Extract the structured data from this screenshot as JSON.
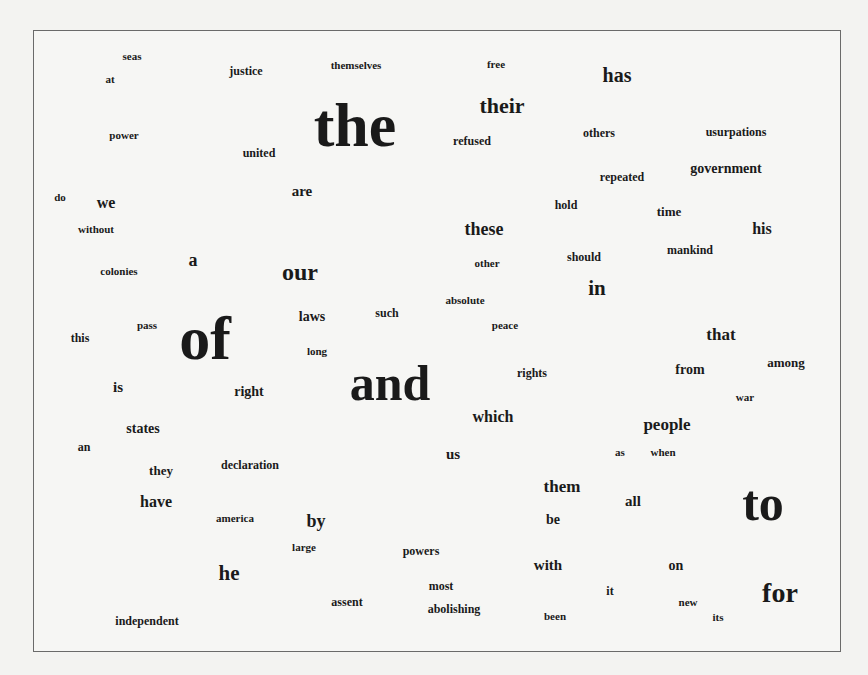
{
  "cloud": {
    "type": "word-cloud",
    "frame": {
      "left": 33,
      "top": 30,
      "right": 842,
      "bottom": 653
    },
    "words": [
      {
        "text": "the",
        "x": 355,
        "y": 125,
        "size": 62
      },
      {
        "text": "of",
        "x": 205,
        "y": 338,
        "size": 62
      },
      {
        "text": "and",
        "x": 390,
        "y": 383,
        "size": 50
      },
      {
        "text": "to",
        "x": 763,
        "y": 503,
        "size": 50
      },
      {
        "text": "for",
        "x": 780,
        "y": 593,
        "size": 28
      },
      {
        "text": "their",
        "x": 502,
        "y": 106,
        "size": 22
      },
      {
        "text": "has",
        "x": 617,
        "y": 75,
        "size": 20
      },
      {
        "text": "our",
        "x": 300,
        "y": 272,
        "size": 24
      },
      {
        "text": "in",
        "x": 597,
        "y": 288,
        "size": 21
      },
      {
        "text": "he",
        "x": 229,
        "y": 573,
        "size": 21
      },
      {
        "text": "these",
        "x": 484,
        "y": 229,
        "size": 18
      },
      {
        "text": "that",
        "x": 721,
        "y": 334,
        "size": 17
      },
      {
        "text": "people",
        "x": 667,
        "y": 424,
        "size": 17
      },
      {
        "text": "them",
        "x": 562,
        "y": 486,
        "size": 17
      },
      {
        "text": "have",
        "x": 156,
        "y": 502,
        "size": 16
      },
      {
        "text": "by",
        "x": 316,
        "y": 521,
        "size": 18
      },
      {
        "text": "which",
        "x": 493,
        "y": 417,
        "size": 16
      },
      {
        "text": "his",
        "x": 762,
        "y": 229,
        "size": 16
      },
      {
        "text": "we",
        "x": 106,
        "y": 203,
        "size": 16
      },
      {
        "text": "a",
        "x": 193,
        "y": 260,
        "size": 18
      },
      {
        "text": "are",
        "x": 302,
        "y": 191,
        "size": 15
      },
      {
        "text": "government",
        "x": 726,
        "y": 169,
        "size": 14
      },
      {
        "text": "laws",
        "x": 312,
        "y": 317,
        "size": 14
      },
      {
        "text": "is",
        "x": 118,
        "y": 387,
        "size": 15
      },
      {
        "text": "right",
        "x": 249,
        "y": 392,
        "size": 14
      },
      {
        "text": "states",
        "x": 143,
        "y": 429,
        "size": 14
      },
      {
        "text": "from",
        "x": 690,
        "y": 370,
        "size": 14
      },
      {
        "text": "among",
        "x": 786,
        "y": 362,
        "size": 13
      },
      {
        "text": "us",
        "x": 453,
        "y": 454,
        "size": 15
      },
      {
        "text": "all",
        "x": 633,
        "y": 501,
        "size": 15
      },
      {
        "text": "be",
        "x": 553,
        "y": 520,
        "size": 14
      },
      {
        "text": "with",
        "x": 548,
        "y": 565,
        "size": 15
      },
      {
        "text": "on",
        "x": 676,
        "y": 566,
        "size": 14
      },
      {
        "text": "they",
        "x": 161,
        "y": 470,
        "size": 13
      },
      {
        "text": "mankind",
        "x": 690,
        "y": 250,
        "size": 12
      },
      {
        "text": "seas",
        "x": 132,
        "y": 56,
        "size": 11
      },
      {
        "text": "at",
        "x": 110,
        "y": 79,
        "size": 11
      },
      {
        "text": "justice",
        "x": 246,
        "y": 71,
        "size": 12
      },
      {
        "text": "themselves",
        "x": 356,
        "y": 65,
        "size": 11
      },
      {
        "text": "free",
        "x": 496,
        "y": 64,
        "size": 11
      },
      {
        "text": "power",
        "x": 124,
        "y": 135,
        "size": 11
      },
      {
        "text": "united",
        "x": 259,
        "y": 153,
        "size": 12
      },
      {
        "text": "refused",
        "x": 472,
        "y": 141,
        "size": 12
      },
      {
        "text": "others",
        "x": 599,
        "y": 133,
        "size": 12
      },
      {
        "text": "usurpations",
        "x": 736,
        "y": 132,
        "size": 12
      },
      {
        "text": "repeated",
        "x": 622,
        "y": 177,
        "size": 12
      },
      {
        "text": "hold",
        "x": 566,
        "y": 205,
        "size": 12
      },
      {
        "text": "time",
        "x": 669,
        "y": 211,
        "size": 13
      },
      {
        "text": "do",
        "x": 60,
        "y": 197,
        "size": 11
      },
      {
        "text": "without",
        "x": 96,
        "y": 229,
        "size": 11
      },
      {
        "text": "colonies",
        "x": 119,
        "y": 271,
        "size": 11
      },
      {
        "text": "other",
        "x": 487,
        "y": 263,
        "size": 11
      },
      {
        "text": "should",
        "x": 584,
        "y": 257,
        "size": 12
      },
      {
        "text": "absolute",
        "x": 465,
        "y": 300,
        "size": 11
      },
      {
        "text": "such",
        "x": 387,
        "y": 313,
        "size": 12
      },
      {
        "text": "peace",
        "x": 505,
        "y": 325,
        "size": 11
      },
      {
        "text": "pass",
        "x": 147,
        "y": 325,
        "size": 11
      },
      {
        "text": "this",
        "x": 80,
        "y": 338,
        "size": 12
      },
      {
        "text": "long",
        "x": 317,
        "y": 351,
        "size": 11
      },
      {
        "text": "rights",
        "x": 532,
        "y": 373,
        "size": 12
      },
      {
        "text": "war",
        "x": 745,
        "y": 397,
        "size": 11
      },
      {
        "text": "an",
        "x": 84,
        "y": 447,
        "size": 12
      },
      {
        "text": "declaration",
        "x": 250,
        "y": 465,
        "size": 12
      },
      {
        "text": "as",
        "x": 620,
        "y": 452,
        "size": 11
      },
      {
        "text": "when",
        "x": 663,
        "y": 452,
        "size": 11
      },
      {
        "text": "america",
        "x": 235,
        "y": 518,
        "size": 11
      },
      {
        "text": "large",
        "x": 304,
        "y": 547,
        "size": 11
      },
      {
        "text": "powers",
        "x": 421,
        "y": 551,
        "size": 12
      },
      {
        "text": "most",
        "x": 441,
        "y": 586,
        "size": 12
      },
      {
        "text": "it",
        "x": 610,
        "y": 591,
        "size": 12
      },
      {
        "text": "assent",
        "x": 347,
        "y": 602,
        "size": 12
      },
      {
        "text": "abolishing",
        "x": 454,
        "y": 609,
        "size": 12
      },
      {
        "text": "new",
        "x": 688,
        "y": 602,
        "size": 11
      },
      {
        "text": "been",
        "x": 555,
        "y": 616,
        "size": 11
      },
      {
        "text": "its",
        "x": 718,
        "y": 617,
        "size": 11
      },
      {
        "text": "independent",
        "x": 147,
        "y": 621,
        "size": 12
      }
    ]
  },
  "colors": {
    "background": "#f3f3f1",
    "text": "#1a1a1a",
    "frame_border": "#6a6a6a"
  }
}
